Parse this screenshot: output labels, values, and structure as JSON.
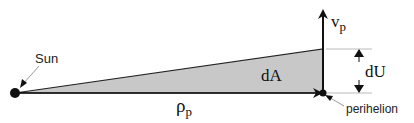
{
  "diagram": {
    "type": "orbital-area-sweep",
    "labels": {
      "sun": "Sun",
      "velocity_symbol": "v",
      "velocity_subscript": "p",
      "area": "dA",
      "displacement": "dU",
      "radius_symbol": "ρ",
      "radius_subscript": "p",
      "perihelion": "perihelion"
    },
    "colors": {
      "triangle_fill": "#c8c8c8",
      "line": "#111111",
      "guide_line": "#bbbbbb",
      "pointer_line": "#999999"
    }
  }
}
